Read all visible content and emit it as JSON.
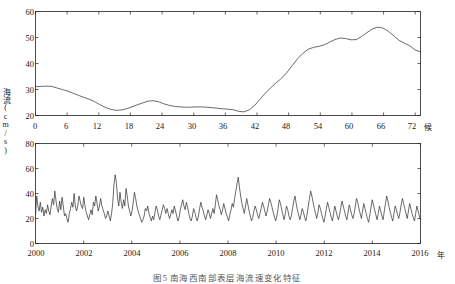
{
  "figure": {
    "caption": "图5   南海西南部表层海流速变化特征",
    "y_axis_label": "海流(cm/s)"
  },
  "chart_data": [
    {
      "type": "line",
      "title": "",
      "panel": "top",
      "xlabel": "候",
      "ylabel": "海流(cm/s)",
      "xlim": [
        0,
        73
      ],
      "ylim": [
        20,
        60
      ],
      "xticks": [
        0,
        6,
        12,
        18,
        24,
        30,
        36,
        42,
        48,
        54,
        60,
        66,
        72
      ],
      "yticks": [
        20,
        30,
        40,
        50,
        60
      ],
      "grid": false,
      "legend": null,
      "x": [
        0,
        1,
        2,
        3,
        4,
        5,
        6,
        7,
        8,
        9,
        10,
        11,
        12,
        13,
        14,
        15,
        16,
        17,
        18,
        19,
        20,
        21,
        22,
        23,
        24,
        25,
        26,
        27,
        28,
        29,
        30,
        31,
        32,
        33,
        34,
        35,
        36,
        37,
        38,
        39,
        40,
        41,
        42,
        43,
        44,
        45,
        46,
        47,
        48,
        49,
        50,
        51,
        52,
        53,
        54,
        55,
        56,
        57,
        58,
        59,
        60,
        61,
        62,
        63,
        64,
        65,
        66,
        67,
        68,
        69,
        70,
        71,
        72
      ],
      "values": [
        31.1,
        31.2,
        31.3,
        31.2,
        30.6,
        30.0,
        29.4,
        28.6,
        27.8,
        27.0,
        26.3,
        25.4,
        24.2,
        23.2,
        22.4,
        22.0,
        22.1,
        22.6,
        23.3,
        24.1,
        24.8,
        25.5,
        25.7,
        25.3,
        24.5,
        23.9,
        23.5,
        23.3,
        23.2,
        23.2,
        23.3,
        23.3,
        23.2,
        23.0,
        22.8,
        22.6,
        22.4,
        22.2,
        21.6,
        21.4,
        22.2,
        23.9,
        26.3,
        28.6,
        30.7,
        32.6,
        34.3,
        36.5,
        39.2,
        41.8,
        43.9,
        45.5,
        46.2,
        46.6,
        47.2,
        48.2,
        49.2,
        49.8,
        49.6,
        49.1,
        49.2,
        50.4,
        51.9,
        53.3,
        54.0,
        53.6,
        52.4,
        50.7,
        48.9,
        47.8,
        46.8,
        45.2,
        44.5
      ],
      "note_series_mapping": "x values are pentad index 0..72; top-panel curve is the climatological annual cycle of surface current speed"
    },
    {
      "type": "line",
      "title": "",
      "panel": "bottom",
      "xlabel": "年",
      "ylabel": "海流(cm/s)",
      "xlim": [
        2000,
        2016
      ],
      "ylim": [
        0,
        80
      ],
      "xticks": [
        2000,
        2002,
        2004,
        2006,
        2008,
        2010,
        2012,
        2014,
        2016
      ],
      "yticks": [
        0,
        20,
        40,
        60,
        80
      ],
      "grid": false,
      "legend": null,
      "x_description": "monthly / sub-seasonal samples from 2000 to 2016",
      "values": [
        22,
        38,
        30,
        26,
        33,
        25,
        29,
        22,
        27,
        24,
        31,
        26,
        23,
        30,
        36,
        31,
        42,
        34,
        28,
        25,
        34,
        27,
        37,
        30,
        22,
        24,
        20,
        17,
        24,
        28,
        33,
        29,
        40,
        30,
        26,
        30,
        38,
        34,
        30,
        28,
        37,
        30,
        25,
        22,
        19,
        23,
        27,
        23,
        33,
        30,
        38,
        32,
        26,
        30,
        36,
        30,
        27,
        24,
        20,
        22,
        26,
        22,
        18,
        24,
        32,
        47,
        55,
        49,
        36,
        30,
        41,
        33,
        28,
        35,
        30,
        44,
        38,
        30,
        26,
        22,
        26,
        33,
        41,
        36,
        30,
        26,
        23,
        20,
        17,
        19,
        22,
        28,
        26,
        30,
        24,
        21,
        18,
        22,
        19,
        25,
        30,
        27,
        22,
        19,
        23,
        27,
        31,
        28,
        24,
        28,
        24,
        20,
        23,
        27,
        24,
        30,
        26,
        22,
        18,
        21,
        27,
        31,
        35,
        30,
        27,
        33,
        29,
        24,
        20,
        18,
        22,
        28,
        25,
        21,
        18,
        22,
        28,
        33,
        29,
        26,
        22,
        19,
        23,
        27,
        24,
        20,
        24,
        28,
        24,
        31,
        39,
        35,
        30,
        27,
        23,
        27,
        32,
        28,
        24,
        21,
        18,
        23,
        27,
        32,
        29,
        36,
        42,
        48,
        53,
        45,
        38,
        32,
        28,
        24,
        30,
        36,
        31,
        26,
        22,
        18,
        21,
        26,
        30,
        27,
        23,
        20,
        24,
        28,
        33,
        30,
        26,
        22,
        26,
        31,
        36,
        33,
        29,
        25,
        21,
        18,
        22,
        28,
        35,
        32,
        27,
        23,
        19,
        24,
        30,
        27,
        22,
        19,
        22,
        28,
        34,
        38,
        32,
        27,
        23,
        19,
        23,
        28,
        25,
        21,
        18,
        23,
        30,
        36,
        42,
        38,
        33,
        28,
        24,
        20,
        25,
        31,
        28,
        24,
        20,
        17,
        22,
        28,
        33,
        29,
        25,
        21,
        18,
        24,
        30,
        26,
        22,
        19,
        23,
        29,
        34,
        30,
        26,
        22,
        19,
        25,
        31,
        27,
        23,
        20,
        24,
        30,
        36,
        33,
        28,
        24,
        20,
        26,
        32,
        28,
        24,
        20,
        17,
        23,
        29,
        35,
        31,
        27,
        23,
        19,
        24,
        30,
        26,
        22,
        19,
        26,
        32,
        38,
        34,
        29,
        25,
        21,
        18,
        24,
        30,
        27,
        23,
        20,
        25,
        31,
        36,
        32,
        28,
        24,
        20,
        26,
        32,
        28,
        24,
        21,
        18,
        24,
        30,
        26,
        22,
        19
      ]
    }
  ],
  "axes": {
    "top": {
      "yticks": [
        "20",
        "30",
        "40",
        "50",
        "60"
      ],
      "xticks": [
        "0",
        "6",
        "12",
        "18",
        "24",
        "30",
        "36",
        "42",
        "48",
        "54",
        "60",
        "66",
        "72"
      ],
      "x_unit": "候"
    },
    "bottom": {
      "yticks": [
        "0",
        "20",
        "40",
        "60",
        "80"
      ],
      "xticks": [
        "2000",
        "2002",
        "2004",
        "2006",
        "2008",
        "2010",
        "2012",
        "2014",
        "2016"
      ],
      "x_unit": "年"
    }
  }
}
